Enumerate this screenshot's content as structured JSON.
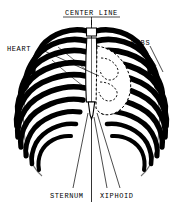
{
  "diagram": {
    "background_color": "#ffffff",
    "ink_color": "#000000",
    "labels": {
      "center_line": "CENTER LINE",
      "heart": "HEART",
      "ribs": "RIBS",
      "sternum": "STERNUM",
      "xiphoid": "XIPHOID"
    },
    "label_styles": {
      "center_line_underlined": true,
      "font_case": "uppercase",
      "font_size_px": 7
    },
    "anatomy": {
      "rib_pairs_drawn": 10,
      "center_line_is_vertical": true,
      "heart_outline_style": "dashed",
      "sternum_fill": "#ffffff",
      "xiphoid_shape": "small downward point below sternum"
    },
    "leader_lines": {
      "center_line": 1,
      "heart": 1,
      "ribs": 2,
      "sternum": 1,
      "xiphoid": 2
    }
  }
}
